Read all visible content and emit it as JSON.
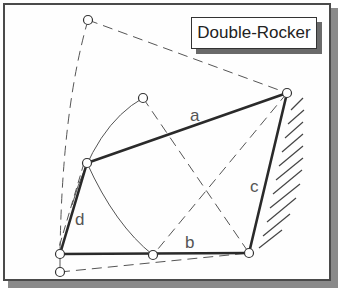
{
  "title": "Double-Rocker",
  "colors": {
    "link": "#2a2a2a",
    "construction": "#555555",
    "frame_border": "#4a4a4a",
    "shadow": "#8a8a8a"
  },
  "links": [
    {
      "name": "a",
      "label": "a"
    },
    {
      "name": "b",
      "label": "b"
    },
    {
      "name": "c",
      "label": "c"
    },
    {
      "name": "d",
      "label": "d"
    }
  ],
  "pivots": [
    {
      "name": "ground-left",
      "x": 60,
      "y": 254
    },
    {
      "name": "ground-right",
      "x": 249,
      "y": 253
    },
    {
      "name": "coupler-right",
      "x": 287,
      "y": 93
    },
    {
      "name": "coupler-left",
      "x": 87,
      "y": 163
    },
    {
      "name": "extreme-top",
      "x": 88,
      "y": 20
    },
    {
      "name": "extreme-mid",
      "x": 143,
      "y": 98
    },
    {
      "name": "extreme-bottom-mid",
      "x": 153,
      "y": 255
    },
    {
      "name": "extreme-bottom-left",
      "x": 60,
      "y": 272
    }
  ]
}
